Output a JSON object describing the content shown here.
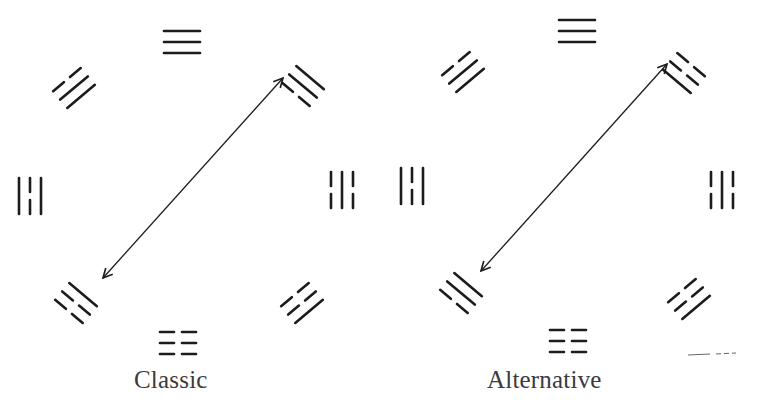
{
  "diagram": {
    "ink_color": "#1c1c1c",
    "caption_color": "#3a3a3a",
    "panels": [
      {
        "id": "classic",
        "caption": "Classic",
        "swap_arrow": {
          "from": [
            283,
            78
          ],
          "to": [
            103,
            278
          ],
          "double_headed": true
        },
        "trigrams": [
          {
            "position": "top",
            "x": 182,
            "y": 42,
            "angle": 0,
            "lines": [
              "solid",
              "solid",
              "solid"
            ]
          },
          {
            "position": "upper-left",
            "x": 74,
            "y": 88,
            "angle": -40,
            "lines": [
              "broken",
              "solid",
              "solid"
            ]
          },
          {
            "position": "upper-right",
            "x": 303,
            "y": 86,
            "angle": 40,
            "lines": [
              "solid",
              "solid",
              "broken"
            ]
          },
          {
            "position": "left",
            "x": 30,
            "y": 196,
            "angle": 90,
            "lines": [
              "solid",
              "broken",
              "solid"
            ]
          },
          {
            "position": "right",
            "x": 342,
            "y": 190,
            "angle": 90,
            "lines": [
              "broken",
              "solid",
              "broken"
            ]
          },
          {
            "position": "lower-left",
            "x": 76,
            "y": 303,
            "angle": 40,
            "lines": [
              "solid",
              "broken",
              "broken"
            ]
          },
          {
            "position": "lower-right",
            "x": 302,
            "y": 303,
            "angle": -40,
            "lines": [
              "broken",
              "broken",
              "solid"
            ]
          },
          {
            "position": "bottom",
            "x": 178,
            "y": 343,
            "angle": 0,
            "lines": [
              "broken",
              "broken",
              "broken"
            ]
          }
        ]
      },
      {
        "id": "alternative",
        "caption": "Alternative",
        "swap_arrow": {
          "from": [
            667,
            64
          ],
          "to": [
            481,
            271
          ],
          "double_headed": true
        },
        "trigrams": [
          {
            "position": "top",
            "x": 577,
            "y": 31,
            "angle": 0,
            "lines": [
              "solid",
              "solid",
              "solid"
            ]
          },
          {
            "position": "upper-left",
            "x": 463,
            "y": 72,
            "angle": -40,
            "lines": [
              "broken",
              "solid",
              "solid"
            ]
          },
          {
            "position": "upper-right",
            "x": 684,
            "y": 73,
            "angle": 40,
            "lines": [
              "broken",
              "broken",
              "solid"
            ]
          },
          {
            "position": "left",
            "x": 412,
            "y": 186,
            "angle": 90,
            "lines": [
              "solid",
              "broken",
              "solid"
            ]
          },
          {
            "position": "right",
            "x": 722,
            "y": 190,
            "angle": 90,
            "lines": [
              "broken",
              "solid",
              "broken"
            ]
          },
          {
            "position": "lower-left",
            "x": 461,
            "y": 293,
            "angle": 40,
            "lines": [
              "solid",
              "solid",
              "broken"
            ]
          },
          {
            "position": "lower-right",
            "x": 689,
            "y": 299,
            "angle": -40,
            "lines": [
              "broken",
              "broken",
              "solid"
            ]
          },
          {
            "position": "bottom",
            "x": 568,
            "y": 341,
            "angle": 0,
            "lines": [
              "broken",
              "broken",
              "broken"
            ]
          }
        ]
      }
    ],
    "stray_mark": {
      "description": "faint dashed scan mark",
      "x": 688,
      "y": 355
    }
  }
}
